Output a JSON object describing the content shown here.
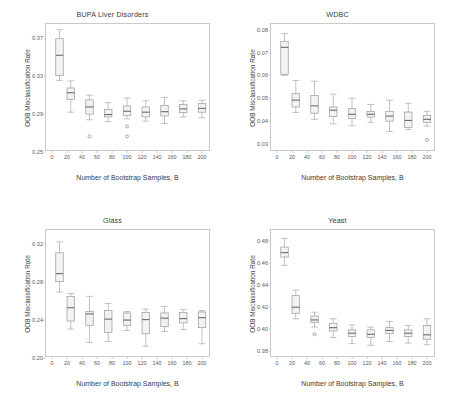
{
  "figure": {
    "shared_xlabel": "Number of Bootstrap Samples, B",
    "shared_ylabel": "OOB Misclassification Rate",
    "background_color": "#ffffff",
    "box_fill_color": "#f2f2f2",
    "box_edge_color": "#9a9a9a",
    "median_color": "#6b6b6b",
    "axis_color": "#c9c9c9"
  },
  "chart_data": [
    {
      "type": "box",
      "panel": "top-left",
      "title": "BUPA Liver Disorders",
      "xlabel": "Number of Bootstrap Samples, B",
      "ylabel": "OOB Misclassification Rate",
      "xlim": [
        -8,
        212
      ],
      "ylim": [
        0.25,
        0.385
      ],
      "xticks": [
        0,
        20,
        40,
        60,
        80,
        100,
        120,
        140,
        160,
        180,
        200
      ],
      "yticks": [
        0.25,
        0.29,
        0.33,
        0.37
      ],
      "ytick_labels": [
        "0.25",
        "0.29",
        "0.33",
        "0.37"
      ],
      "grid": false,
      "categories": [
        10,
        25,
        50,
        75,
        100,
        125,
        150,
        175,
        200
      ],
      "boxes": [
        {
          "x": 10,
          "whisker_low": 0.3255,
          "q1": 0.3305,
          "median": 0.352,
          "q3": 0.3695,
          "whisker_high": 0.379,
          "outliers": []
        },
        {
          "x": 25,
          "whisker_low": 0.292,
          "q1": 0.3055,
          "median": 0.3125,
          "q3": 0.3175,
          "whisker_high": 0.325,
          "outliers": []
        },
        {
          "x": 50,
          "whisker_low": 0.284,
          "q1": 0.29,
          "median": 0.2975,
          "q3": 0.305,
          "whisker_high": 0.31,
          "outliers": [
            0.2665
          ]
        },
        {
          "x": 75,
          "whisker_low": 0.282,
          "q1": 0.287,
          "median": 0.2895,
          "q3": 0.295,
          "whisker_high": 0.302,
          "outliers": []
        },
        {
          "x": 100,
          "whisker_low": 0.285,
          "q1": 0.2885,
          "median": 0.293,
          "q3": 0.2985,
          "whisker_high": 0.307,
          "outliers": [
            0.277,
            0.2665
          ]
        },
        {
          "x": 125,
          "whisker_low": 0.2825,
          "q1": 0.287,
          "median": 0.292,
          "q3": 0.2975,
          "whisker_high": 0.304,
          "outliers": []
        },
        {
          "x": 150,
          "whisker_low": 0.28,
          "q1": 0.288,
          "median": 0.2925,
          "q3": 0.299,
          "whisker_high": 0.3075,
          "outliers": []
        },
        {
          "x": 175,
          "whisker_low": 0.287,
          "q1": 0.2915,
          "median": 0.2955,
          "q3": 0.3,
          "whisker_high": 0.304,
          "outliers": []
        },
        {
          "x": 200,
          "whisker_low": 0.286,
          "q1": 0.292,
          "median": 0.296,
          "q3": 0.301,
          "whisker_high": 0.3045,
          "outliers": []
        }
      ]
    },
    {
      "type": "box",
      "panel": "top-right",
      "title": "WDBC",
      "xlabel": "Number of Bootstrap Samples, B",
      "ylabel": "OOB Misclassification Rate",
      "xlim": [
        -8,
        212
      ],
      "ylim": [
        0.0265,
        0.0825
      ],
      "xticks": [
        0,
        20,
        40,
        60,
        80,
        100,
        120,
        140,
        160,
        180,
        200
      ],
      "yticks": [
        0.03,
        0.04,
        0.05,
        0.06,
        0.07,
        0.08
      ],
      "ytick_labels": [
        "0.03",
        "0.04",
        "0.05",
        "0.06",
        "0.07",
        "0.08"
      ],
      "grid": false,
      "categories": [
        10,
        25,
        50,
        75,
        100,
        125,
        150,
        175,
        200
      ],
      "boxes": [
        {
          "x": 10,
          "whisker_low": 0.06,
          "q1": 0.0605,
          "median": 0.0723,
          "q3": 0.0748,
          "whisker_high": 0.0783,
          "outliers": []
        },
        {
          "x": 25,
          "whisker_low": 0.0438,
          "q1": 0.0462,
          "median": 0.0492,
          "q3": 0.052,
          "whisker_high": 0.0578,
          "outliers": []
        },
        {
          "x": 50,
          "whisker_low": 0.0408,
          "q1": 0.0435,
          "median": 0.0467,
          "q3": 0.0512,
          "whisker_high": 0.0575,
          "outliers": []
        },
        {
          "x": 75,
          "whisker_low": 0.0388,
          "q1": 0.042,
          "median": 0.0448,
          "q3": 0.0462,
          "whisker_high": 0.0518,
          "outliers": []
        },
        {
          "x": 100,
          "whisker_low": 0.038,
          "q1": 0.0412,
          "median": 0.043,
          "q3": 0.0455,
          "whisker_high": 0.05,
          "outliers": []
        },
        {
          "x": 125,
          "whisker_low": 0.0395,
          "q1": 0.0418,
          "median": 0.043,
          "q3": 0.0443,
          "whisker_high": 0.0473,
          "outliers": []
        },
        {
          "x": 150,
          "whisker_low": 0.0355,
          "q1": 0.04,
          "median": 0.0422,
          "q3": 0.0443,
          "whisker_high": 0.0492,
          "outliers": []
        },
        {
          "x": 175,
          "whisker_low": 0.0363,
          "q1": 0.0372,
          "median": 0.0403,
          "q3": 0.044,
          "whisker_high": 0.0478,
          "outliers": []
        },
        {
          "x": 200,
          "whisker_low": 0.0378,
          "q1": 0.0395,
          "median": 0.0408,
          "q3": 0.0425,
          "whisker_high": 0.0443,
          "outliers": [
            0.0318
          ]
        }
      ]
    },
    {
      "type": "box",
      "panel": "bottom-left",
      "title": "Glass",
      "xlabel": "Number of Bootstrap Samples, B",
      "ylabel": "OOB Misclassification Rate",
      "xlim": [
        -8,
        212
      ],
      "ylim": [
        0.2,
        0.335
      ],
      "xticks": [
        0,
        20,
        40,
        60,
        80,
        100,
        120,
        140,
        160,
        180,
        200
      ],
      "yticks": [
        0.2,
        0.24,
        0.28,
        0.32
      ],
      "ytick_labels": [
        "0.20",
        "0.24",
        "0.28",
        "0.32"
      ],
      "grid": false,
      "categories": [
        10,
        25,
        50,
        75,
        100,
        125,
        150,
        175,
        200
      ],
      "boxes": [
        {
          "x": 10,
          "whisker_low": 0.2695,
          "q1": 0.2805,
          "median": 0.289,
          "q3": 0.311,
          "whisker_high": 0.3225,
          "outliers": []
        },
        {
          "x": 25,
          "whisker_low": 0.2305,
          "q1": 0.239,
          "median": 0.253,
          "q3": 0.265,
          "whisker_high": 0.268,
          "outliers": []
        },
        {
          "x": 50,
          "whisker_low": 0.2165,
          "q1": 0.2345,
          "median": 0.2465,
          "q3": 0.249,
          "whisker_high": 0.265,
          "outliers": []
        },
        {
          "x": 75,
          "whisker_low": 0.2175,
          "q1": 0.227,
          "median": 0.241,
          "q3": 0.25,
          "whisker_high": 0.2575,
          "outliers": []
        },
        {
          "x": 100,
          "whisker_low": 0.229,
          "q1": 0.2345,
          "median": 0.24,
          "q3": 0.2475,
          "whisker_high": 0.249,
          "outliers": []
        },
        {
          "x": 125,
          "whisker_low": 0.2125,
          "q1": 0.2255,
          "median": 0.2405,
          "q3": 0.248,
          "whisker_high": 0.2515,
          "outliers": []
        },
        {
          "x": 150,
          "whisker_low": 0.228,
          "q1": 0.233,
          "median": 0.242,
          "q3": 0.2475,
          "whisker_high": 0.2545,
          "outliers": []
        },
        {
          "x": 175,
          "whisker_low": 0.23,
          "q1": 0.237,
          "median": 0.2415,
          "q3": 0.248,
          "whisker_high": 0.251,
          "outliers": []
        },
        {
          "x": 200,
          "whisker_low": 0.215,
          "q1": 0.232,
          "median": 0.2425,
          "q3": 0.2485,
          "whisker_high": 0.25,
          "outliers": []
        }
      ]
    },
    {
      "type": "box",
      "panel": "bottom-right",
      "title": "Yeast",
      "xlabel": "Number of Bootstrap Samples, B",
      "ylabel": "OOB Misclassification Rate",
      "xlim": [
        -8,
        212
      ],
      "ylim": [
        0.374,
        0.49
      ],
      "xticks": [
        0,
        20,
        40,
        60,
        80,
        100,
        120,
        140,
        160,
        180,
        200
      ],
      "yticks": [
        0.38,
        0.4,
        0.42,
        0.44,
        0.46,
        0.48
      ],
      "ytick_labels": [
        "0.38",
        "0.40",
        "0.42",
        "0.44",
        "0.46",
        "0.48"
      ],
      "grid": false,
      "categories": [
        10,
        25,
        50,
        75,
        100,
        125,
        150,
        175,
        200
      ],
      "boxes": [
        {
          "x": 10,
          "whisker_low": 0.458,
          "q1": 0.4655,
          "median": 0.4695,
          "q3": 0.4745,
          "whisker_high": 0.4825,
          "outliers": []
        },
        {
          "x": 25,
          "whisker_low": 0.4095,
          "q1": 0.4145,
          "median": 0.42,
          "q3": 0.4305,
          "whisker_high": 0.4355,
          "outliers": []
        },
        {
          "x": 50,
          "whisker_low": 0.402,
          "q1": 0.406,
          "median": 0.4085,
          "q3": 0.412,
          "whisker_high": 0.4155,
          "outliers": [
            0.3955
          ]
        },
        {
          "x": 75,
          "whisker_low": 0.3925,
          "q1": 0.3985,
          "median": 0.4015,
          "q3": 0.4055,
          "whisker_high": 0.4095,
          "outliers": []
        },
        {
          "x": 100,
          "whisker_low": 0.387,
          "q1": 0.3935,
          "median": 0.3965,
          "q3": 0.3995,
          "whisker_high": 0.404,
          "outliers": []
        },
        {
          "x": 125,
          "whisker_low": 0.3855,
          "q1": 0.3925,
          "median": 0.3955,
          "q3": 0.3995,
          "whisker_high": 0.402,
          "outliers": []
        },
        {
          "x": 150,
          "whisker_low": 0.389,
          "q1": 0.396,
          "median": 0.399,
          "q3": 0.4015,
          "whisker_high": 0.407,
          "outliers": []
        },
        {
          "x": 175,
          "whisker_low": 0.3875,
          "q1": 0.3935,
          "median": 0.3965,
          "q3": 0.3995,
          "whisker_high": 0.4035,
          "outliers": []
        },
        {
          "x": 200,
          "whisker_low": 0.386,
          "q1": 0.391,
          "median": 0.395,
          "q3": 0.4035,
          "whisker_high": 0.4095,
          "outliers": []
        }
      ]
    }
  ]
}
